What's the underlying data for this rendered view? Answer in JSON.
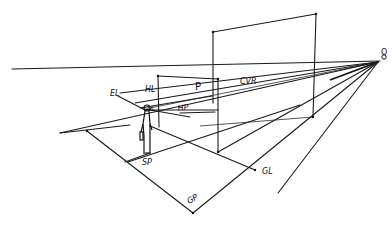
{
  "diagram": {
    "type": "perspective-picture-plane-sketch",
    "labels": {
      "eye_level": "EL",
      "horizon_line": "HL",
      "picture_plane": "P",
      "central_visual_ray": "CVR",
      "horizontal_plane": "HP",
      "as_label": "AS",
      "station_point": "SP",
      "ground_line": "GL",
      "ground_plane": "GP",
      "vanishing_point": "O"
    },
    "colors": {
      "ink": "#111111",
      "background": "#ffffff"
    }
  }
}
